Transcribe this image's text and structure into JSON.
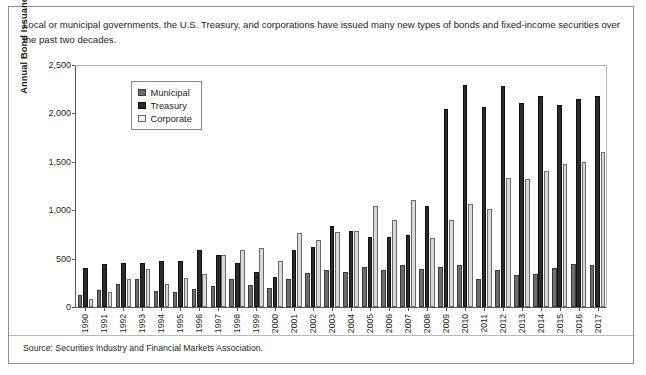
{
  "intro_text": "Local or municipal governments, the U.S. Treasury, and corporations have issued many new types of bonds and fixed-income securities over the past two decades.",
  "source_text": "Source: Securities Industry and Financial Markets Association.",
  "legend": {
    "items": [
      {
        "label": "Municipal",
        "key": "municipal",
        "color": "#6e6e6e"
      },
      {
        "label": "Treasury",
        "key": "treasury",
        "color": "#2b2b2b"
      },
      {
        "label": "Corporate",
        "key": "corporate",
        "color": "#f2f2f2"
      }
    ]
  },
  "chart_data": {
    "type": "bar",
    "title": "",
    "xlabel": "",
    "ylabel": "Annual Bond Issuance ($ Billions)",
    "ylim": [
      0,
      2500
    ],
    "yticks": [
      0,
      500,
      1000,
      1500,
      2000,
      2500
    ],
    "ytick_labels": [
      "0",
      "500",
      "1,000",
      "1,500",
      "2,000",
      "2,500"
    ],
    "grid": false,
    "legend_position": "upper-left-inside",
    "categories": [
      "1990",
      "1991",
      "1992",
      "1993",
      "1994",
      "1995",
      "1996",
      "1997",
      "1998",
      "1999",
      "2000",
      "2001",
      "2002",
      "2003",
      "2004",
      "2005",
      "2006",
      "2007",
      "2008",
      "2009",
      "2010",
      "2011",
      "2012",
      "2013",
      "2014",
      "2015",
      "2016",
      "2017"
    ],
    "series": [
      {
        "name": "Municipal",
        "color": "#6e6e6e",
        "values": [
          128,
          175,
          235,
          290,
          165,
          160,
          185,
          220,
          285,
          225,
          200,
          290,
          355,
          380,
          360,
          410,
          385,
          430,
          390,
          410,
          433,
          290,
          380,
          335,
          340,
          400,
          445,
          435
        ]
      },
      {
        "name": "Treasury",
        "color": "#2b2b2b",
        "values": [
          400,
          440,
          455,
          450,
          475,
          480,
          590,
          540,
          455,
          365,
          310,
          590,
          620,
          840,
          790,
          720,
          720,
          740,
          1040,
          2050,
          2290,
          2070,
          2280,
          2110,
          2180,
          2090,
          2150,
          2180
        ]
      },
      {
        "name": "Corporate",
        "color": "#d9d9d9",
        "values": [
          80,
          155,
          290,
          390,
          235,
          300,
          345,
          540,
          590,
          605,
          475,
          760,
          690,
          780,
          790,
          1040,
          900,
          1105,
          710,
          900,
          1065,
          1010,
          1330,
          1320,
          1410,
          1480,
          1500,
          1600
        ]
      }
    ]
  }
}
